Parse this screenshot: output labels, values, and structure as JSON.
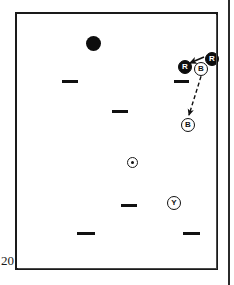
{
  "page": {
    "number_label": "20",
    "background_color": "#ffffff",
    "ink_color": "#111111"
  },
  "frame": {
    "name": "diagram-frame",
    "border_color": "#1a1a1a"
  },
  "page_edge": {
    "name": "page-edge-rule",
    "color": "#2b2b2b"
  },
  "diagram": {
    "title": "",
    "markers": [
      {
        "id": "disc-1",
        "type": "filled-disc",
        "x": 69,
        "y": 22,
        "size": 15
      }
    ],
    "dashes": [
      {
        "id": "dash-1",
        "x": 45,
        "y": 66,
        "width": 16
      },
      {
        "id": "dash-2",
        "x": 95,
        "y": 96,
        "width": 16
      },
      {
        "id": "dash-3",
        "x": 157,
        "y": 66,
        "width": 15
      },
      {
        "id": "dash-4",
        "x": 104,
        "y": 190,
        "width": 16
      },
      {
        "id": "dash-5",
        "x": 60,
        "y": 218,
        "width": 18
      },
      {
        "id": "dash-6",
        "x": 166,
        "y": 218,
        "width": 17
      }
    ],
    "dot_target": {
      "id": "dot-target-1",
      "x": 110,
      "y": 143,
      "size": 11,
      "label": "ringed-dot"
    },
    "tokens": [
      {
        "id": "token-r-left",
        "letter": "R",
        "style": "filled",
        "x": 161,
        "y": 46,
        "size": 14
      },
      {
        "id": "token-r-right",
        "letter": "R",
        "style": "filled",
        "x": 188,
        "y": 38,
        "size": 14
      },
      {
        "id": "token-b-top",
        "letter": "B",
        "style": "open",
        "x": 177,
        "y": 48,
        "size": 14
      },
      {
        "id": "token-b-bottom",
        "letter": "B",
        "style": "open",
        "x": 164,
        "y": 104,
        "size": 14
      },
      {
        "id": "token-y",
        "letter": "Y",
        "style": "open",
        "x": 150,
        "y": 182,
        "size": 14
      }
    ],
    "arrows": [
      {
        "id": "arrow-r-solid",
        "style": "solid",
        "from": {
          "x": 187,
          "y": 43
        },
        "to": {
          "x": 173,
          "y": 49
        },
        "color": "#111111",
        "description": "solid arrow pointing left from right R token to left R token"
      },
      {
        "id": "arrow-b-dashed",
        "style": "dashed",
        "from": {
          "x": 186,
          "y": 56
        },
        "to": {
          "x": 172,
          "y": 101
        },
        "color": "#111111",
        "description": "dashed arrow from upper B token down-left to lower B token"
      }
    ]
  }
}
